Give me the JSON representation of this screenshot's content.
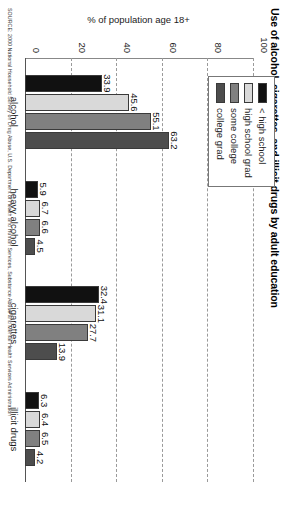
{
  "chart_data": {
    "type": "bar",
    "title": "Use of alcohol, cigarettes, and illicit drugs by adult education",
    "xlabel": "",
    "ylabel": "% of population age 18+",
    "ylim": [
      0,
      100
    ],
    "yticks": [
      0,
      20,
      40,
      60,
      80,
      100
    ],
    "grid": true,
    "legend_position": "top-left",
    "orientation": "vertical-bars",
    "categories": [
      "alcohol",
      "heavy alcohol",
      "cigarettes",
      "illicit drugs"
    ],
    "series": [
      {
        "name": "< high school",
        "color": "#111111",
        "values": [
          33.9,
          5.9,
          32.4,
          6.3
        ]
      },
      {
        "name": "high school grad",
        "color": "#d9d9d9",
        "values": [
          45.6,
          6.7,
          31.1,
          6.4
        ]
      },
      {
        "name": "some college",
        "color": "#808080",
        "values": [
          55.1,
          6.6,
          27.7,
          6.5
        ]
      },
      {
        "name": "college grad",
        "color": "#4d4d4d",
        "values": [
          63.2,
          4.5,
          13.9,
          4.2
        ]
      }
    ],
    "source": "SOURCE: 2000 National Household Survey on Drug Abuse, U.S. Department of Health and Human Services, Substance Abuse and Mental Health Services Administration"
  },
  "labels": {
    "tick_0": "0",
    "tick_20": "20",
    "tick_40": "40",
    "tick_60": "60",
    "tick_80": "80",
    "tick_100": "100"
  },
  "values_text": {
    "alcohol": [
      "33.9",
      "45.6",
      "55.1",
      "63.2"
    ],
    "heavy_alcohol": [
      "5.9",
      "6.7",
      "6.6",
      "4.5"
    ],
    "cigarettes": [
      "32.4",
      "31.1",
      "27.7",
      "13.9"
    ],
    "illicit_drugs": [
      "6.3",
      "6.4",
      "6.5",
      "4.2"
    ]
  }
}
